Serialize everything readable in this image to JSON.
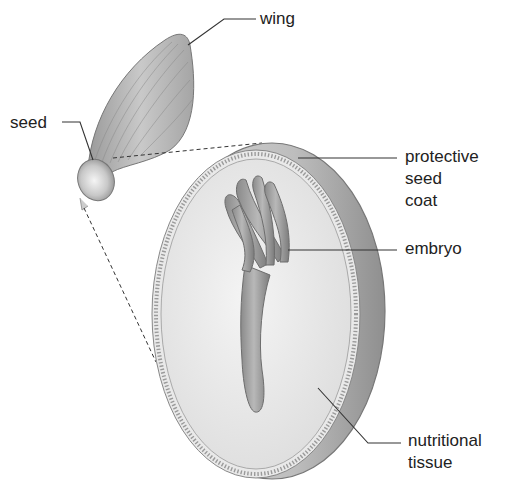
{
  "diagram": {
    "labels": {
      "wing": "wing",
      "seed": "seed",
      "seed_coat": [
        "protective",
        "seed",
        "coat"
      ],
      "embryo": "embryo",
      "nutritional_tissue": [
        "nutritional",
        "tissue"
      ]
    }
  },
  "colors": {
    "ink": "#222222",
    "line": "#333333",
    "shade_dark": "#8a8a8a",
    "shade_mid": "#b5b5b5",
    "shade_light": "#e4e4e4"
  }
}
